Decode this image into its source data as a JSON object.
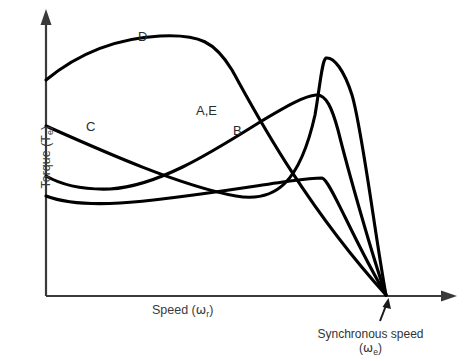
{
  "figure": {
    "background_color": "#ffffff",
    "curve_color": "#000000",
    "axis_color": "#3a3a3a"
  },
  "axes": {
    "y_label_text": "Torque (",
    "y_label_symbol": "T",
    "y_label_subscript": "e",
    "y_label_close": ")",
    "x_label_text": "Speed (",
    "x_label_symbol": "ω",
    "x_label_subscript": "r",
    "x_label_close": ")",
    "y_axis_full": "Torque (Te)",
    "x_axis_full": "Speed (ωr)"
  },
  "annotations": {
    "sync_line1": "Synchronous speed",
    "sync_symbol_open": "(",
    "sync_symbol": "ω",
    "sync_subscript": "e",
    "sync_symbol_close": ")",
    "sync_full": "Synchronous speed (ωe)"
  },
  "curve_labels": [
    {
      "id": "D",
      "text": "D"
    },
    {
      "id": "C",
      "text": "C"
    },
    {
      "id": "AE",
      "text": "A,E"
    },
    {
      "id": "B",
      "text": "B"
    }
  ],
  "chart_data": {
    "type": "line",
    "title": "",
    "xlabel": "Speed (ωr)",
    "ylabel": "Torque (Te)",
    "grid": false,
    "legend_position": "inline-curve-labels",
    "axis_arrows": true,
    "convergence_point_label": "Synchronous speed (ωe)",
    "series": [
      {
        "name": "D",
        "label": "D",
        "description": "High starting torque, broad flat maximum, falls steeply to synchronous speed",
        "path": "M 46,80 C 80,52 120,38 160,36 C 200,34 215,42 232,70 C 250,102 300,200 386,295"
      },
      {
        "name": "C",
        "label": "C",
        "description": "Starts at moderate torque, decreases monotonically, rises to a tall sharp peak then drops to synchronous speed",
        "path": "M 46,126 C 100,150 180,186 236,196 C 276,203 300,182 315,115 C 320,86 322,60 326,58 C 334,57 344,70 352,95 C 362,128 375,235 386,295"
      },
      {
        "name": "A,E",
        "label": "A,E",
        "description": "Low starting torque with slight dip, rises steadily to a medium peak then drops to synchronous speed",
        "path": "M 46,176 C 60,184 80,190 110,189 C 160,186 215,150 260,122 C 290,104 305,96 316,95 C 326,94 332,108 338,130 C 348,170 372,255 386,295"
      },
      {
        "name": "B",
        "label": "B",
        "description": "Lowest starting torque, nearly flat across the speed range, then drops abruptly to synchronous speed",
        "path": "M 46,196 C 62,202 86,205 120,203 C 170,200 240,188 290,181 C 305,179 315,178 322,178 C 330,179 352,238 386,295"
      }
    ]
  }
}
